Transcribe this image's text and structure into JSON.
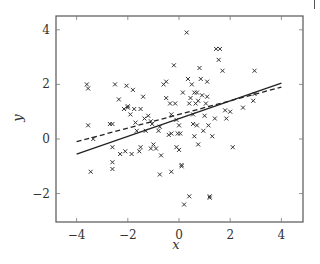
{
  "chart_data": {
    "type": "scatter",
    "title": "",
    "xlabel": "x",
    "ylabel": "y",
    "xlim": [
      -4.8,
      4.8
    ],
    "ylim": [
      -3.0,
      4.5
    ],
    "xticks": [
      -4,
      -2,
      0,
      2,
      4
    ],
    "xtick_labels": [
      "−4",
      "−2",
      "0",
      "2",
      "4"
    ],
    "yticks": [
      -2,
      0,
      2,
      4
    ],
    "ytick_labels": [
      "−2",
      "0",
      "2",
      "4"
    ],
    "grid": false,
    "legend": null,
    "marker": "x",
    "points": [
      [
        -3.6,
        2.0
      ],
      [
        -3.55,
        1.85
      ],
      [
        -3.55,
        0.5
      ],
      [
        -3.45,
        -1.2
      ],
      [
        -3.35,
        0.0
      ],
      [
        -2.7,
        0.55
      ],
      [
        -2.6,
        0.55
      ],
      [
        -2.6,
        -0.3
      ],
      [
        -2.6,
        -0.85
      ],
      [
        -2.6,
        -1.1
      ],
      [
        -2.5,
        2.0
      ],
      [
        -2.35,
        1.45
      ],
      [
        -2.3,
        -0.55
      ],
      [
        -2.15,
        1.1
      ],
      [
        -2.1,
        -0.45
      ],
      [
        -2.05,
        1.95
      ],
      [
        -2.0,
        1.2
      ],
      [
        -2.0,
        1.15
      ],
      [
        -1.9,
        0.9
      ],
      [
        -1.85,
        -0.55
      ],
      [
        -1.8,
        1.8
      ],
      [
        -1.75,
        1.1
      ],
      [
        -1.7,
        0.6
      ],
      [
        -1.65,
        0.3
      ],
      [
        -1.55,
        -0.45
      ],
      [
        -1.5,
        1.1
      ],
      [
        -1.5,
        -0.3
      ],
      [
        -1.4,
        1.55
      ],
      [
        -1.35,
        0.75
      ],
      [
        -1.3,
        0.3
      ],
      [
        -1.2,
        0.85
      ],
      [
        -1.1,
        0.65
      ],
      [
        -1.1,
        -0.35
      ],
      [
        -1.05,
        0.55
      ],
      [
        -1.0,
        -0.2
      ],
      [
        -0.9,
        -0.35
      ],
      [
        -0.8,
        0.3
      ],
      [
        -0.75,
        0.45
      ],
      [
        -0.75,
        -1.3
      ],
      [
        -0.7,
        -0.6
      ],
      [
        -0.6,
        2.0
      ],
      [
        -0.5,
        2.1
      ],
      [
        -0.5,
        1.5
      ],
      [
        -0.4,
        0.15
      ],
      [
        -0.35,
        1.3
      ],
      [
        -0.3,
        0.9
      ],
      [
        -0.3,
        0.2
      ],
      [
        -0.3,
        -1.2
      ],
      [
        -0.2,
        2.7
      ],
      [
        -0.15,
        1.3
      ],
      [
        -0.1,
        0.7
      ],
      [
        -0.1,
        -0.3
      ],
      [
        -0.05,
        0.2
      ],
      [
        0.0,
        0.5
      ],
      [
        0.0,
        -0.4
      ],
      [
        0.05,
        0.2
      ],
      [
        0.1,
        -0.95
      ],
      [
        0.1,
        -1.0
      ],
      [
        0.15,
        1.7
      ],
      [
        0.2,
        -2.4
      ],
      [
        0.3,
        3.9
      ],
      [
        0.35,
        2.2
      ],
      [
        0.4,
        1.3
      ],
      [
        0.45,
        1.5
      ],
      [
        0.5,
        2.0
      ],
      [
        0.55,
        0.9
      ],
      [
        0.55,
        0.55
      ],
      [
        0.6,
        1.7
      ],
      [
        0.6,
        0.1
      ],
      [
        0.65,
        1.3
      ],
      [
        0.7,
        1.7
      ],
      [
        0.7,
        0.5
      ],
      [
        0.75,
        -0.2
      ],
      [
        0.75,
        1.4
      ],
      [
        0.8,
        2.6
      ],
      [
        0.85,
        2.2
      ],
      [
        0.9,
        1.6
      ],
      [
        0.95,
        0.3
      ],
      [
        1.0,
        0.85
      ],
      [
        1.05,
        1.3
      ],
      [
        1.1,
        2.1
      ],
      [
        1.1,
        1.55
      ],
      [
        1.15,
        0.5
      ],
      [
        1.2,
        -2.1
      ],
      [
        1.3,
        0.1
      ],
      [
        1.4,
        0.75
      ],
      [
        1.45,
        3.3
      ],
      [
        1.55,
        2.9
      ],
      [
        1.6,
        3.3
      ],
      [
        1.7,
        2.5
      ],
      [
        1.8,
        1.05
      ],
      [
        1.85,
        0.75
      ],
      [
        2.0,
        1.0
      ],
      [
        2.1,
        -0.3
      ],
      [
        2.5,
        1.15
      ],
      [
        2.9,
        1.4
      ],
      [
        2.95,
        2.5
      ],
      [
        2.95,
        1.65
      ],
      [
        0.4,
        -2.1
      ],
      [
        1.2,
        -2.15
      ]
    ],
    "lines": [
      {
        "name": "solid fit",
        "style": "solid",
        "x": [
          -4,
          4
        ],
        "y": [
          -0.55,
          2.05
        ]
      },
      {
        "name": "dashed fit",
        "style": "dashed",
        "x": [
          -4,
          4
        ],
        "y": [
          -0.1,
          1.9
        ]
      }
    ],
    "frame": {
      "left": 56,
      "right": 303,
      "top": 16,
      "bottom": 222
    }
  }
}
